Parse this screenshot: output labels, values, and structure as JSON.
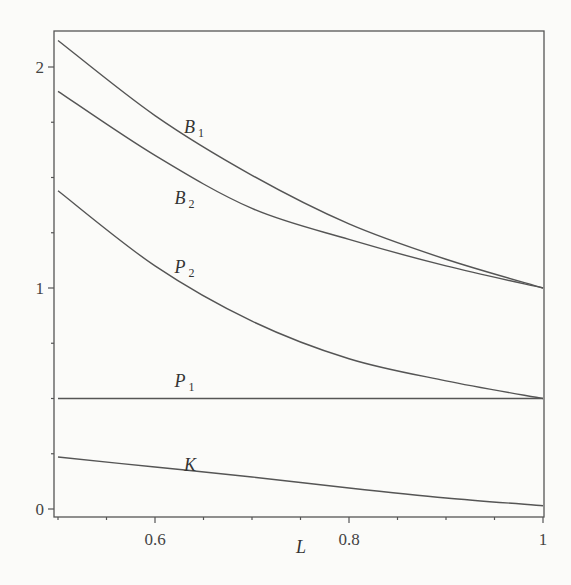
{
  "chart_data": {
    "type": "line",
    "title": "",
    "xlabel": "L",
    "ylabel": "",
    "xlim": [
      0.5,
      1.0
    ],
    "ylim": [
      -0.035,
      2.2
    ],
    "grid": false,
    "legend": "inline curve labels",
    "x_ticks": [
      0.6,
      0.8,
      1
    ],
    "x_tick_labels": [
      "0.6",
      "0.8",
      "1"
    ],
    "x_minor_step": 0.05,
    "y_ticks": [
      0,
      1,
      2
    ],
    "y_tick_labels": [
      "0",
      "1",
      "2"
    ],
    "y_minor_step": 0.25,
    "x": [
      0.5,
      0.6,
      0.7,
      0.8,
      0.9,
      1.0
    ],
    "series": [
      {
        "name": "B1",
        "label_main": "B",
        "label_sub": "1",
        "values": [
          2.12,
          1.78,
          1.51,
          1.29,
          1.13,
          1.0
        ],
        "label_pos": [
          0.63,
          1.7
        ]
      },
      {
        "name": "B2",
        "label_main": "B",
        "label_sub": "2",
        "values": [
          1.89,
          1.6,
          1.36,
          1.22,
          1.1,
          1.0
        ],
        "label_pos": [
          0.62,
          1.38
        ]
      },
      {
        "name": "P2",
        "label_main": "P",
        "label_sub": "2",
        "values": [
          1.44,
          1.1,
          0.85,
          0.68,
          0.58,
          0.5
        ],
        "label_pos": [
          0.62,
          1.07
        ]
      },
      {
        "name": "P1",
        "label_main": "P",
        "label_sub": "1",
        "values": [
          0.5,
          0.5,
          0.5,
          0.5,
          0.5,
          0.5
        ],
        "label_pos": [
          0.62,
          0.55
        ]
      },
      {
        "name": "K",
        "label_main": "K",
        "label_sub": "",
        "values": [
          0.235,
          0.19,
          0.145,
          0.095,
          0.05,
          0.015
        ],
        "label_pos": [
          0.63,
          0.17
        ]
      }
    ]
  }
}
